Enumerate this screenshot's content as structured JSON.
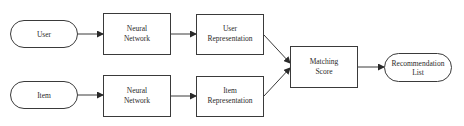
{
  "diagram": {
    "nodes": {
      "user": {
        "label": "User",
        "shape": "pill"
      },
      "nn_top": {
        "line1": "Neural",
        "line2": "Network",
        "shape": "rect"
      },
      "user_rep": {
        "line1": "User",
        "line2": "Representation",
        "shape": "rect"
      },
      "item": {
        "label": "Item",
        "shape": "pill"
      },
      "nn_bottom": {
        "line1": "Neural",
        "line2": "Network",
        "shape": "rect"
      },
      "item_rep": {
        "line1": "Item",
        "line2": "Representation",
        "shape": "rect"
      },
      "matching": {
        "line1": "Matching",
        "line2": "Score",
        "shape": "rect"
      },
      "reclist": {
        "line1": "Recommendation",
        "line2": "List",
        "shape": "pill"
      }
    },
    "edges": [
      {
        "from": "user",
        "to": "nn_top"
      },
      {
        "from": "nn_top",
        "to": "user_rep"
      },
      {
        "from": "user_rep",
        "to": "matching"
      },
      {
        "from": "item",
        "to": "nn_bottom"
      },
      {
        "from": "nn_bottom",
        "to": "item_rep"
      },
      {
        "from": "item_rep",
        "to": "matching"
      },
      {
        "from": "matching",
        "to": "reclist"
      }
    ],
    "colors": {
      "stroke": "#3a3a3a",
      "text": "#2a2a2a",
      "background": "#ffffff"
    }
  }
}
